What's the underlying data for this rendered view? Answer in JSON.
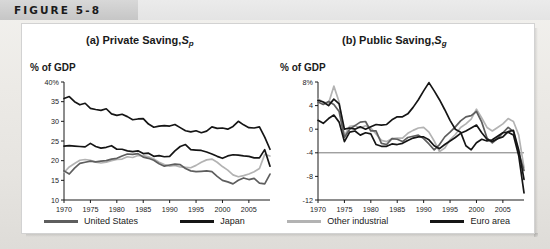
{
  "figure": {
    "label": "FIGURE 5-8"
  },
  "colors": {
    "united_states": "#5e5e5e",
    "japan": "#151515",
    "other_industrial": "#b3b3b3",
    "euro_area": "#151515",
    "axis": "#1a1a1a",
    "panel_bg": "#ffffff",
    "header_band": "#cfcfcf"
  },
  "legend": {
    "items": [
      {
        "label": "United States",
        "color_key": "united_states",
        "color": "#5e5e5e"
      },
      {
        "label": "Japan",
        "color_key": "japan",
        "color": "#151515"
      },
      {
        "label": "Other industrial",
        "color_key": "other_industrial",
        "color": "#b3b3b3"
      },
      {
        "label": "Euro area",
        "color_key": "euro_area",
        "color": "#151515"
      }
    ]
  },
  "charts": [
    {
      "id": "private-saving",
      "title_prefix": "(a) Private Saving,",
      "title_symbol": "S",
      "title_subscript": "p",
      "axis_caption": "% of GDP"
    },
    {
      "id": "public-saving",
      "title_prefix": "(b) Public Saving,",
      "title_symbol": "S",
      "title_subscript": "g",
      "axis_caption": "% of GDP"
    }
  ],
  "chart_data": [
    {
      "type": "line",
      "id": "private-saving",
      "title": "(a) Private Saving, Sp",
      "xlabel": "",
      "ylabel": "% of GDP",
      "ylim": [
        10,
        40
      ],
      "yticks": [
        10,
        15,
        20,
        25,
        30,
        35,
        40
      ],
      "yticklabels": [
        "10",
        "15",
        "20",
        "25",
        "30",
        "35",
        "40%"
      ],
      "xlim": [
        1970,
        2009
      ],
      "xticks": [
        1970,
        1975,
        1980,
        1985,
        1990,
        1995,
        2000,
        2005
      ],
      "xticklabels": [
        "1970",
        "1975",
        "1980",
        "1985",
        "1990",
        "1995",
        "2000",
        "2005"
      ],
      "grid": false,
      "legend_position": "below",
      "x": [
        1970,
        1971,
        1972,
        1973,
        1974,
        1975,
        1976,
        1977,
        1978,
        1979,
        1980,
        1981,
        1982,
        1983,
        1984,
        1985,
        1986,
        1987,
        1988,
        1989,
        1990,
        1991,
        1992,
        1993,
        1994,
        1995,
        1996,
        1997,
        1998,
        1999,
        2000,
        2001,
        2002,
        2003,
        2004,
        2005,
        2006,
        2007,
        2008,
        2009
      ],
      "series": [
        {
          "name": "Japan",
          "color": "#151515",
          "values": [
            35.8,
            36.3,
            35.0,
            34.2,
            34.6,
            33.3,
            33.0,
            32.8,
            33.2,
            31.9,
            31.5,
            31.8,
            31.2,
            30.4,
            30.6,
            30.7,
            29.3,
            28.5,
            28.8,
            28.9,
            28.8,
            29.2,
            28.4,
            27.6,
            27.3,
            27.6,
            27.1,
            27.5,
            28.6,
            28.2,
            28.3,
            28.0,
            28.7,
            30.0,
            29.1,
            28.4,
            28.3,
            28.6,
            26.0,
            22.9
          ]
        },
        {
          "name": "Euro area",
          "color": "#151515",
          "values": [
            23.7,
            23.8,
            23.7,
            23.6,
            23.5,
            24.4,
            23.6,
            23.2,
            23.4,
            23.8,
            22.9,
            22.9,
            22.5,
            22.3,
            22.5,
            21.8,
            21.9,
            21.1,
            21.3,
            21.0,
            21.1,
            22.5,
            23.6,
            24.1,
            22.8,
            22.7,
            22.6,
            22.2,
            21.7,
            21.1,
            20.6,
            21.2,
            21.5,
            21.4,
            21.2,
            21.1,
            20.7,
            20.7,
            22.8,
            18.6
          ]
        },
        {
          "name": "Other industrial",
          "color": "#b3b3b3",
          "values": [
            17.0,
            18.4,
            19.3,
            20.1,
            20.3,
            20.1,
            19.6,
            19.4,
            19.6,
            20.0,
            20.3,
            20.4,
            21.0,
            20.8,
            21.3,
            21.3,
            21.0,
            20.4,
            19.6,
            19.0,
            18.6,
            18.8,
            18.4,
            18.3,
            18.2,
            18.8,
            19.6,
            20.2,
            20.4,
            19.6,
            18.5,
            17.6,
            16.4,
            15.9,
            16.2,
            16.6,
            17.2,
            18.0,
            21.6,
            21.2
          ]
        },
        {
          "name": "United States",
          "color": "#5e5e5e",
          "values": [
            17.4,
            16.6,
            18.1,
            19.3,
            19.6,
            19.9,
            19.7,
            19.9,
            20.0,
            20.4,
            20.6,
            21.2,
            21.7,
            21.6,
            21.8,
            20.9,
            20.6,
            20.1,
            19.2,
            18.6,
            18.9,
            19.1,
            19.0,
            18.0,
            17.4,
            17.2,
            17.3,
            17.4,
            17.2,
            16.0,
            15.0,
            14.6,
            14.1,
            15.0,
            15.6,
            15.2,
            15.5,
            14.3,
            14.1,
            16.6
          ]
        }
      ]
    },
    {
      "type": "line",
      "id": "public-saving",
      "title": "(b) Public Saving, Sg",
      "xlabel": "",
      "ylabel": "% of GDP",
      "ylim": [
        -12,
        8
      ],
      "yticks": [
        -12,
        -8,
        -4,
        0,
        4,
        8
      ],
      "yticklabels": [
        "-12",
        "-8",
        "-4",
        "0",
        "4",
        "8%"
      ],
      "xlim": [
        1970,
        2009
      ],
      "xticks": [
        1970,
        1975,
        1980,
        1985,
        1990,
        1995,
        2000,
        2005
      ],
      "xticklabels": [
        "1970",
        "1975",
        "1980",
        "1985",
        "1990",
        "1995",
        "2000",
        "2005"
      ],
      "grid": false,
      "zero_reference_line": -4,
      "legend_position": "below",
      "x": [
        1970,
        1971,
        1972,
        1973,
        1974,
        1975,
        1976,
        1977,
        1978,
        1979,
        1980,
        1981,
        1982,
        1983,
        1984,
        1985,
        1986,
        1987,
        1988,
        1989,
        1990,
        1991,
        1992,
        1993,
        1994,
        1995,
        1996,
        1997,
        1998,
        1999,
        2000,
        2001,
        2002,
        2003,
        2004,
        2005,
        2006,
        2007,
        2008,
        2009
      ],
      "series": [
        {
          "name": "Japan",
          "color": "#151515",
          "values": [
            4.9,
            4.6,
            4.0,
            5.1,
            4.3,
            0.0,
            0.2,
            0.0,
            0.4,
            0.0,
            0.4,
            0.8,
            0.7,
            0.8,
            1.6,
            2.1,
            2.1,
            2.6,
            3.7,
            5.0,
            6.5,
            7.9,
            6.5,
            5.0,
            3.3,
            1.5,
            0.0,
            -0.5,
            -2.8,
            -3.5,
            -2.3,
            -1.7,
            -2.0,
            -1.8,
            -1.2,
            -0.6,
            -0.5,
            -1.0,
            -4.5,
            -10.8
          ]
        },
        {
          "name": "United States",
          "color": "#5e5e5e",
          "values": [
            4.6,
            4.2,
            4.7,
            4.2,
            3.0,
            -1.4,
            0.0,
            0.6,
            1.2,
            1.3,
            -0.3,
            -0.3,
            -2.4,
            -2.6,
            -1.6,
            -1.7,
            -2.1,
            -1.4,
            -1.2,
            -1.0,
            -1.6,
            -2.5,
            -3.5,
            -2.6,
            -1.3,
            -0.5,
            0.4,
            1.4,
            2.1,
            2.3,
            3.0,
            1.2,
            -1.5,
            -2.3,
            -1.6,
            -0.6,
            0.3,
            -0.4,
            -4.0,
            -7.0
          ]
        },
        {
          "name": "Other industrial",
          "color": "#b3b3b3",
          "values": [
            5.1,
            4.6,
            4.4,
            7.3,
            4.6,
            -1.1,
            0.5,
            0.6,
            0.2,
            0.6,
            0.2,
            -0.8,
            -1.9,
            -2.1,
            -1.6,
            -1.5,
            -1.5,
            -0.7,
            -0.2,
            0.2,
            0.3,
            -0.5,
            -2.0,
            -3.8,
            -3.2,
            -1.8,
            -0.9,
            0.3,
            0.9,
            1.7,
            3.4,
            1.9,
            0.3,
            -0.3,
            0.3,
            0.9,
            1.8,
            1.3,
            -1.0,
            -6.5
          ]
        },
        {
          "name": "Euro area",
          "color": "#151515",
          "values": [
            1.5,
            1.0,
            1.8,
            2.4,
            1.2,
            -2.1,
            -0.5,
            -0.3,
            -1.0,
            -0.6,
            -0.8,
            -2.6,
            -2.9,
            -2.9,
            -2.5,
            -2.6,
            -2.4,
            -1.9,
            -1.5,
            -1.3,
            -1.3,
            -1.8,
            -2.8,
            -3.3,
            -2.6,
            -2.0,
            -1.4,
            -0.7,
            -0.3,
            0.2,
            0.7,
            -0.6,
            -1.7,
            -2.1,
            -1.6,
            -1.3,
            -0.4,
            -0.2,
            -3.5,
            -8.5
          ]
        }
      ]
    }
  ]
}
